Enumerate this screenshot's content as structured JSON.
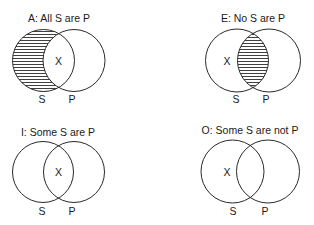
{
  "diagram": {
    "type": "venn-categorical-propositions",
    "panels": [
      {
        "id": "A",
        "title": "A: All S are P",
        "circles": [
          {
            "label": "S"
          },
          {
            "label": "P"
          }
        ],
        "shaded_region": "S only (S outside P)",
        "x_mark": "X",
        "x_region": "S and P intersection"
      },
      {
        "id": "E",
        "title": "E: No S are P",
        "circles": [
          {
            "label": "S"
          },
          {
            "label": "P"
          }
        ],
        "shaded_region": "S and P intersection",
        "x_mark": "X",
        "x_region": "S only"
      },
      {
        "id": "I",
        "title": "I: Some S are P",
        "circles": [
          {
            "label": "S"
          },
          {
            "label": "P"
          }
        ],
        "shaded_region": "none",
        "x_mark": "X",
        "x_region": "S and P intersection"
      },
      {
        "id": "O",
        "title": "O: Some S are not P",
        "circles": [
          {
            "label": "S"
          },
          {
            "label": "P"
          }
        ],
        "shaded_region": "none",
        "x_mark": "X",
        "x_region": "S only"
      }
    ],
    "colors": {
      "stroke": "#2a2a2a",
      "text": "#1a1a1a",
      "background": "#ffffff"
    }
  }
}
